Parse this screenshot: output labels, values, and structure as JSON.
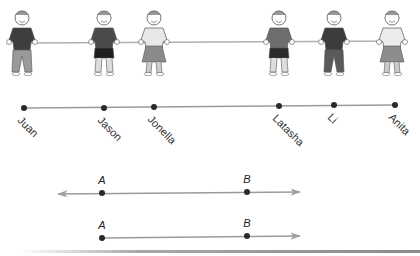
{
  "figures": [
    {
      "name": "Juan",
      "x": 22,
      "shirt": "#3e3e3e",
      "bottom": "#9a9a9a",
      "type": "pants"
    },
    {
      "name": "Jason",
      "x": 104,
      "shirt": "#4a4a4a",
      "bottom": "#1e1e1e",
      "type": "shorts"
    },
    {
      "name": "Jonella",
      "x": 154,
      "shirt": "#e8e8e8",
      "bottom": "#8a8a8a",
      "type": "skirt"
    },
    {
      "name": "Latasha",
      "x": 279,
      "shirt": "#6e6e6e",
      "bottom": "#2a2a2a",
      "type": "shorts"
    },
    {
      "name": "Li",
      "x": 334,
      "shirt": "#3c3c3c",
      "bottom": "#5a5a5a",
      "type": "pants"
    },
    {
      "name": "Anita",
      "x": 392,
      "shirt": "#ececec",
      "bottom": "#8c8c8c",
      "type": "skirt"
    }
  ],
  "number_line": {
    "points": [
      {
        "label": "Juan",
        "x": 24,
        "y": 108
      },
      {
        "label": "Jason",
        "x": 104,
        "y": 108
      },
      {
        "label": "Jonella",
        "x": 154,
        "y": 107
      },
      {
        "label": "Latasha",
        "x": 279,
        "y": 106
      },
      {
        "label": "Li",
        "x": 334,
        "y": 105
      },
      {
        "label": "Anita",
        "x": 395,
        "y": 105
      }
    ]
  },
  "line_AB": {
    "type": "line",
    "point_a": {
      "label": "A",
      "x": 102,
      "y": 193
    },
    "point_b": {
      "label": "B",
      "x": 247,
      "y": 192
    }
  },
  "ray_AB": {
    "type": "ray",
    "point_a": {
      "label": "A",
      "x": 102,
      "y": 238
    },
    "point_b": {
      "label": "B",
      "x": 247,
      "y": 236
    }
  },
  "colors": {
    "line": "#9a9a9a",
    "dot": "#2a2a2a",
    "rope": "#b0b0b0",
    "skin": "#ffffff",
    "outline": "#555555"
  }
}
